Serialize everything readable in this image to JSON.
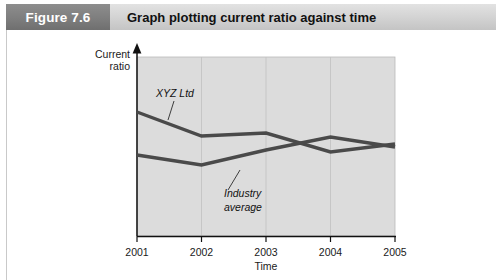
{
  "header": {
    "figure_number": "Figure 7.6",
    "title": "Graph plotting current ratio against time",
    "number_box_color": "#7e7e7e",
    "band_color": "#d2d2d2",
    "number_text_color": "#ffffff",
    "title_text_color": "#111111"
  },
  "chart_data": {
    "type": "line",
    "title": "Graph plotting current ratio against time",
    "xlabel": "Time",
    "ylabel": "Current ratio",
    "ylabel_line1": "Current",
    "ylabel_line2": "ratio",
    "categories": [
      "2001",
      "2002",
      "2003",
      "2004",
      "2005"
    ],
    "x": [
      2001,
      2002,
      2003,
      2004,
      2005
    ],
    "grid": "vertical",
    "legend": "inline-annotations",
    "axis_style": "arrow-headed y-axis, plain x-axis baseline",
    "plot_background": "#dcdcdc",
    "line_color": "#4a4a4a",
    "ylim": [
      0,
      10
    ],
    "yticks_shown": false,
    "series": [
      {
        "name": "XYZ Ltd",
        "label_line1": "XYZ Ltd",
        "label_line2": "",
        "values": [
          7.6,
          6.3,
          6.5,
          5.4,
          5.9
        ],
        "pixel_y": [
          112,
          136,
          133,
          152,
          144
        ]
      },
      {
        "name": "Industry average",
        "label_line1": "Industry",
        "label_line2": "average",
        "values": [
          5.1,
          4.5,
          5.4,
          6.3,
          5.7
        ],
        "pixel_y": [
          155,
          165,
          150,
          137,
          147
        ]
      }
    ],
    "annotations": [
      {
        "text": "XYZ Ltd",
        "points_to": "XYZ Ltd series"
      },
      {
        "text": "Industry average",
        "points_to": "Industry average series"
      }
    ]
  }
}
